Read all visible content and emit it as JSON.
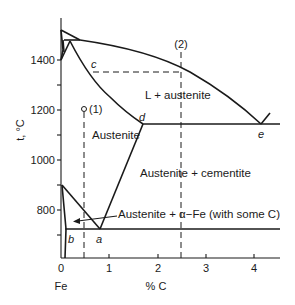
{
  "diagram": {
    "y_axis": {
      "label": "t, °C",
      "ticks": [
        {
          "value": 1400,
          "label": "1400"
        },
        {
          "value": 1200,
          "label": "1200"
        },
        {
          "value": 1000,
          "label": "1000"
        },
        {
          "value": 800,
          "label": "800"
        }
      ]
    },
    "x_axis": {
      "label": "% C",
      "origin_label": "Fe",
      "ticks": [
        {
          "value": 0,
          "label": "0"
        },
        {
          "value": 1,
          "label": "1"
        },
        {
          "value": 2,
          "label": "2"
        },
        {
          "value": 3,
          "label": "3"
        },
        {
          "value": 4,
          "label": "4"
        }
      ]
    },
    "regions": {
      "liquid_austenite": "L + austenite",
      "austenite": "Austenite",
      "austenite_cementite": "Austenite + cementite",
      "austenite_alpha": "Austenite + α−Fe (with some C)"
    },
    "points": {
      "a": "a",
      "b": "b",
      "c": "c",
      "d": "d",
      "e": "e"
    },
    "markers": {
      "one": "(1)",
      "two": "(2)"
    }
  }
}
